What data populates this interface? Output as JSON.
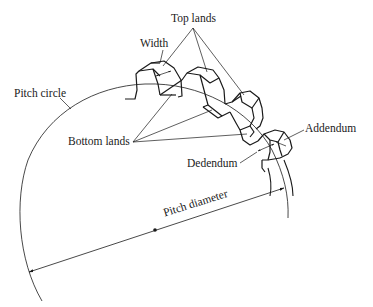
{
  "diagram": {
    "colors": {
      "ink": "#1a1a1a",
      "background": "#ffffff"
    },
    "labels": {
      "top_lands": "Top lands",
      "width": "Width",
      "pitch_circle": "Pitch circle",
      "bottom_lands": "Bottom lands",
      "addendum": "Addendum",
      "dedendum": "Dedendum",
      "pitch_diameter": "Pitch diameter"
    },
    "elements": [
      {
        "id": "pitch-circle-arc",
        "type": "arc"
      },
      {
        "id": "gear-teeth",
        "type": "shape-group",
        "count": 4
      },
      {
        "id": "pitch-diameter-line",
        "type": "dimension-line",
        "arrows": "both"
      },
      {
        "id": "center-point",
        "type": "point"
      }
    ]
  }
}
